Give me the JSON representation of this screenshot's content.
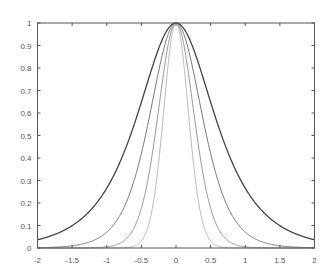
{
  "chart_data": {
    "type": "line",
    "title": "",
    "xlabel": "",
    "ylabel": "",
    "xlim": [
      -2,
      2
    ],
    "ylim": [
      0,
      1
    ],
    "grid": false,
    "legend": null,
    "x_ticks": [
      -2,
      -1.5,
      -1,
      -0.5,
      0,
      0.5,
      1,
      1.5,
      2
    ],
    "x_tick_labels": [
      "-2",
      "-1.5",
      "-1",
      "-0.5",
      "0",
      "0.5",
      "1",
      "1.5",
      "2"
    ],
    "y_ticks": [
      0,
      0.1,
      0.2,
      0.3,
      0.4,
      0.5,
      0.6,
      0.7,
      0.8,
      0.9,
      1
    ],
    "y_tick_labels": [
      "0",
      "0.1",
      "0.2",
      "0.3",
      "0.4",
      "0.5",
      "0.6",
      "0.7",
      "0.8",
      "0.9",
      "1"
    ],
    "x": [
      -2,
      -1.5,
      -1,
      -0.75,
      -0.5,
      -0.25,
      0,
      0.25,
      0.5,
      0.75,
      1,
      1.5,
      2
    ],
    "series": [
      {
        "name": "curve-1 (widest)",
        "formula": "sech(2x)",
        "power": 1,
        "color": "#444444",
        "values": [
          0.037,
          0.099,
          0.266,
          0.425,
          0.648,
          0.887,
          1.0,
          0.887,
          0.648,
          0.425,
          0.266,
          0.099,
          0.037
        ]
      },
      {
        "name": "curve-2",
        "formula": "sech(2x)^2",
        "power": 2,
        "color": "#777777",
        "values": [
          0.001,
          0.01,
          0.071,
          0.181,
          0.42,
          0.786,
          1.0,
          0.786,
          0.42,
          0.181,
          0.071,
          0.01,
          0.001
        ]
      },
      {
        "name": "curve-3",
        "formula": "sech(2x)^4",
        "power": 4,
        "color": "#999999",
        "values": [
          0.0,
          0.0,
          0.005,
          0.033,
          0.176,
          0.618,
          1.0,
          0.618,
          0.176,
          0.033,
          0.005,
          0.0,
          0.0
        ]
      },
      {
        "name": "curve-4 (narrowest)",
        "formula": "sech(2x)^8",
        "power": 8,
        "color": "#bbbbbb",
        "values": [
          0.0,
          0.0,
          0.0,
          0.001,
          0.031,
          0.382,
          1.0,
          0.382,
          0.031,
          0.001,
          0.0,
          0.0,
          0.0
        ]
      }
    ]
  },
  "plot": {
    "left": 37.5,
    "right": 314.5,
    "top": 23,
    "bottom": 248,
    "axis_color": "#555555",
    "background": "#ffffff"
  }
}
